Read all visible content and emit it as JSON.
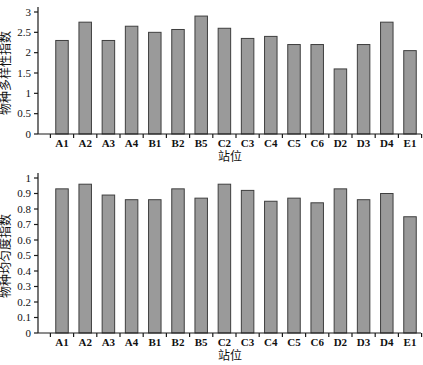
{
  "figure": {
    "bar_fill": "#9a9a9a",
    "bar_stroke": "#3f3f3f",
    "axis_color": "#1a1a1a",
    "background": "#ffffff"
  },
  "chart_data": [
    {
      "type": "bar",
      "title": "",
      "xlabel": "站位",
      "ylabel": "物种多样性指数",
      "ylim": [
        0,
        3
      ],
      "yticks": [
        0,
        0.5,
        1,
        1.5,
        2,
        2.5,
        3
      ],
      "grid": false,
      "legend": null,
      "categories": [
        "A1",
        "A2",
        "A3",
        "A4",
        "B1",
        "B2",
        "B5",
        "C2",
        "C3",
        "C4",
        "C5",
        "C6",
        "D2",
        "D3",
        "D4",
        "E1"
      ],
      "values": [
        2.3,
        2.75,
        2.3,
        2.65,
        2.5,
        2.57,
        2.9,
        2.6,
        2.35,
        2.4,
        2.2,
        2.2,
        1.6,
        2.2,
        2.75,
        2.05
      ]
    },
    {
      "type": "bar",
      "title": "",
      "xlabel": "站位",
      "ylabel": "物种均匀度指数",
      "ylim": [
        0,
        1
      ],
      "yticks": [
        0,
        0.1,
        0.2,
        0.3,
        0.4,
        0.5,
        0.6,
        0.7,
        0.8,
        0.9,
        1
      ],
      "grid": false,
      "legend": null,
      "categories": [
        "A1",
        "A2",
        "A3",
        "A4",
        "B1",
        "B2",
        "B5",
        "C2",
        "C3",
        "C4",
        "C5",
        "C6",
        "D2",
        "D3",
        "D4",
        "E1"
      ],
      "values": [
        0.93,
        0.96,
        0.89,
        0.86,
        0.86,
        0.93,
        0.87,
        0.96,
        0.92,
        0.85,
        0.87,
        0.84,
        0.93,
        0.86,
        0.9,
        0.75
      ]
    }
  ]
}
